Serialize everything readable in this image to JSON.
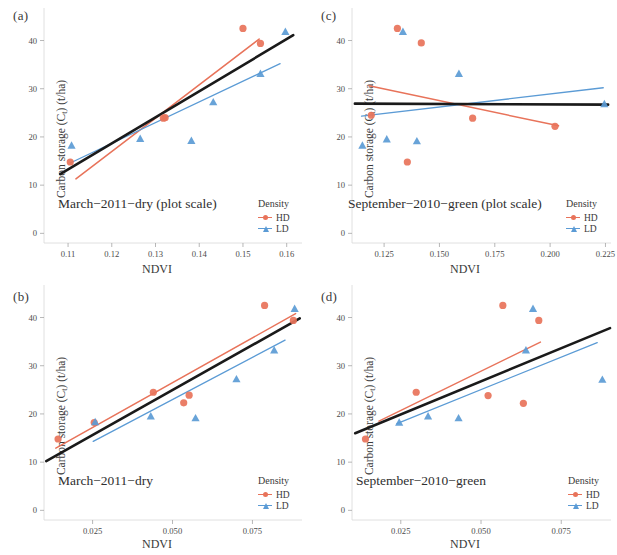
{
  "figure": {
    "ylabel_main": "Carbon storage (C",
    "ylabel_sub": "t",
    "ylabel_tail": ") (t/ha)",
    "xlabel": "NDVI",
    "legend_title": "Density",
    "legend_hd": "HD",
    "legend_ld": "LD"
  },
  "colors": {
    "hd": "#e8735a",
    "ld": "#5b9bd5",
    "overall": "#1a1a1a",
    "axis": "#d8d8d8",
    "text": "#3a3a3a"
  },
  "chart_data": [
    {
      "type": "scatter",
      "panel": "(a)",
      "title": "March−2011−dry (plot scale)",
      "xlabel": "NDVI",
      "ylabel": "Carbon storage (Ct) (t/ha)",
      "xlim": [
        0.1045,
        0.1635
      ],
      "ylim": [
        -2.0,
        45.5
      ],
      "xticks": [
        0.11,
        0.12,
        0.13,
        0.14,
        0.15,
        0.16
      ],
      "xticklabels": [
        "0.11",
        "0.12",
        "0.13",
        "0.14",
        "0.15",
        "0.16"
      ],
      "yticks": [
        0,
        10,
        20,
        30,
        40
      ],
      "yticklabels": [
        "0",
        "10",
        "20",
        "30",
        "40"
      ],
      "grid": false,
      "legend_position": "bottom-right",
      "series": [
        {
          "name": "HD",
          "marker": "circle",
          "color": "#e8735a",
          "points": [
            {
              "x": 0.1105,
              "y": 14.8
            },
            {
              "x": 0.1318,
              "y": 23.9
            },
            {
              "x": 0.1322,
              "y": 24.0
            },
            {
              "x": 0.15,
              "y": 42.5
            },
            {
              "x": 0.154,
              "y": 39.4
            }
          ],
          "fit_line": {
            "x0": 0.1118,
            "y0": 11.3,
            "x1": 0.1537,
            "y1": 40.3
          }
        },
        {
          "name": "LD",
          "marker": "triangle",
          "color": "#5b9bd5",
          "points": [
            {
              "x": 0.1108,
              "y": 18.2
            },
            {
              "x": 0.1265,
              "y": 19.6
            },
            {
              "x": 0.1382,
              "y": 19.2
            },
            {
              "x": 0.1432,
              "y": 27.2
            },
            {
              "x": 0.154,
              "y": 33.1
            },
            {
              "x": 0.1597,
              "y": 41.8
            }
          ],
          "fit_line": {
            "x0": 0.1105,
            "y0": 14.6,
            "x1": 0.1585,
            "y1": 35.2
          }
        },
        {
          "name": "Overall",
          "marker": "none",
          "color": "#1a1a1a",
          "points": [],
          "fit_line": {
            "x0": 0.1082,
            "y0": 12.3,
            "x1": 0.1615,
            "y1": 41.1
          }
        }
      ]
    },
    {
      "type": "scatter",
      "panel": "(c)",
      "title": "September−2010−green (plot scale)",
      "xlabel": "NDVI",
      "ylabel": "Carbon storage (Ct) (t/ha)",
      "xlim": [
        0.1105,
        0.2275
      ],
      "ylim": [
        -2.0,
        45.5
      ],
      "xticks": [
        0.125,
        0.15,
        0.175,
        0.2,
        0.225
      ],
      "xticklabels": [
        "0.125",
        "0.150",
        "0.175",
        "0.200",
        "0.225"
      ],
      "yticks": [
        0,
        10,
        20,
        30,
        40
      ],
      "yticklabels": [
        "0",
        "10",
        "20",
        "30",
        "40"
      ],
      "grid": false,
      "legend_position": "bottom-right",
      "series": [
        {
          "name": "HD",
          "marker": "circle",
          "color": "#e8735a",
          "points": [
            {
              "x": 0.1192,
              "y": 24.5
            },
            {
              "x": 0.131,
              "y": 42.5
            },
            {
              "x": 0.1355,
              "y": 14.8
            },
            {
              "x": 0.1418,
              "y": 39.5
            },
            {
              "x": 0.165,
              "y": 23.9
            },
            {
              "x": 0.2022,
              "y": 22.2
            }
          ],
          "fit_line": {
            "x0": 0.1182,
            "y0": 30.6,
            "x1": 0.2038,
            "y1": 22.3
          }
        },
        {
          "name": "LD",
          "marker": "triangle",
          "color": "#5b9bd5",
          "points": [
            {
              "x": 0.1152,
              "y": 18.2
            },
            {
              "x": 0.1262,
              "y": 19.5
            },
            {
              "x": 0.1335,
              "y": 41.8
            },
            {
              "x": 0.1398,
              "y": 19.1
            },
            {
              "x": 0.1588,
              "y": 33.1
            },
            {
              "x": 0.2245,
              "y": 26.8
            }
          ],
          "fit_line": {
            "x0": 0.1148,
            "y0": 24.3,
            "x1": 0.224,
            "y1": 30.2
          }
        },
        {
          "name": "Overall",
          "marker": "none",
          "color": "#1a1a1a",
          "points": [],
          "fit_line": {
            "x0": 0.1118,
            "y0": 26.9,
            "x1": 0.2262,
            "y1": 26.7
          }
        }
      ]
    },
    {
      "type": "scatter",
      "panel": "(b)",
      "title": "March−2011−dry",
      "xlabel": "NDVI",
      "ylabel": "Carbon storage (Ct) (t/ha)",
      "xlim": [
        0.0098,
        0.0905
      ],
      "ylim": [
        -2.0,
        45.5
      ],
      "xticks": [
        0.025,
        0.05,
        0.075
      ],
      "xticklabels": [
        "0.025",
        "0.050",
        "0.075"
      ],
      "yticks": [
        0,
        10,
        20,
        30,
        40
      ],
      "yticklabels": [
        "0",
        "10",
        "20",
        "30",
        "40"
      ],
      "grid": false,
      "legend_position": "bottom-right",
      "series": [
        {
          "name": "HD",
          "marker": "circle",
          "color": "#e8735a",
          "points": [
            {
              "x": 0.0142,
              "y": 14.8
            },
            {
              "x": 0.0255,
              "y": 18.2
            },
            {
              "x": 0.044,
              "y": 24.5
            },
            {
              "x": 0.0535,
              "y": 22.3
            },
            {
              "x": 0.0552,
              "y": 23.9
            },
            {
              "x": 0.0788,
              "y": 42.5
            },
            {
              "x": 0.0878,
              "y": 39.4
            }
          ],
          "fit_line": {
            "x0": 0.0135,
            "y0": 12.9,
            "x1": 0.0885,
            "y1": 40.8
          }
        },
        {
          "name": "LD",
          "marker": "triangle",
          "color": "#5b9bd5",
          "points": [
            {
              "x": 0.0258,
              "y": 18.3
            },
            {
              "x": 0.0432,
              "y": 19.5
            },
            {
              "x": 0.0572,
              "y": 19.1
            },
            {
              "x": 0.07,
              "y": 27.2
            },
            {
              "x": 0.0818,
              "y": 33.2
            },
            {
              "x": 0.0882,
              "y": 41.8
            }
          ],
          "fit_line": {
            "x0": 0.0252,
            "y0": 14.3,
            "x1": 0.0852,
            "y1": 35.3
          }
        },
        {
          "name": "Overall",
          "marker": "none",
          "color": "#1a1a1a",
          "points": [],
          "fit_line": {
            "x0": 0.0105,
            "y0": 10.2,
            "x1": 0.0898,
            "y1": 39.8
          }
        }
      ]
    },
    {
      "type": "scatter",
      "panel": "(d)",
      "title": "September−2010−green",
      "xlabel": "NDVI",
      "ylabel": "Carbon storage (Ct) (t/ha)",
      "xlim": [
        0.0098,
        0.0905
      ],
      "ylim": [
        -2.0,
        45.5
      ],
      "xticks": [
        0.025,
        0.05,
        0.075
      ],
      "xticklabels": [
        "0.025",
        "0.050",
        "0.075"
      ],
      "yticks": [
        0,
        10,
        20,
        30,
        40
      ],
      "yticklabels": [
        "0",
        "10",
        "20",
        "30",
        "40"
      ],
      "grid": false,
      "legend_position": "bottom-right",
      "series": [
        {
          "name": "HD",
          "marker": "circle",
          "color": "#e8735a",
          "points": [
            {
              "x": 0.014,
              "y": 14.8
            },
            {
              "x": 0.0298,
              "y": 24.5
            },
            {
              "x": 0.0522,
              "y": 23.8
            },
            {
              "x": 0.0568,
              "y": 42.5
            },
            {
              "x": 0.0632,
              "y": 22.2
            },
            {
              "x": 0.068,
              "y": 39.4
            }
          ],
          "fit_line": {
            "x0": 0.0182,
            "y0": 18.5,
            "x1": 0.0685,
            "y1": 34.9
          }
        },
        {
          "name": "LD",
          "marker": "triangle",
          "color": "#5b9bd5",
          "points": [
            {
              "x": 0.0245,
              "y": 18.2
            },
            {
              "x": 0.0335,
              "y": 19.5
            },
            {
              "x": 0.043,
              "y": 19.1
            },
            {
              "x": 0.064,
              "y": 33.2
            },
            {
              "x": 0.0662,
              "y": 41.8
            },
            {
              "x": 0.0878,
              "y": 27.1
            }
          ],
          "fit_line": {
            "x0": 0.0238,
            "y0": 18.0,
            "x1": 0.0862,
            "y1": 34.8
          }
        },
        {
          "name": "Overall",
          "marker": "none",
          "color": "#1a1a1a",
          "points": [],
          "fit_line": {
            "x0": 0.0108,
            "y0": 16.0,
            "x1": 0.0902,
            "y1": 37.8
          }
        }
      ]
    }
  ]
}
